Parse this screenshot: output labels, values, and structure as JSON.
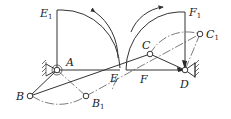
{
  "figure": {
    "type": "linkage-mechanism-diagram",
    "points": {
      "A": {
        "label": "A",
        "sub": ""
      },
      "B": {
        "label": "B",
        "sub": ""
      },
      "B1": {
        "label": "B",
        "sub": "1"
      },
      "C": {
        "label": "C",
        "sub": ""
      },
      "C1": {
        "label": "C",
        "sub": "1"
      },
      "D": {
        "label": "D",
        "sub": ""
      },
      "E": {
        "label": "E",
        "sub": ""
      },
      "E1": {
        "label": "E",
        "sub": "1"
      },
      "F": {
        "label": "F",
        "sub": ""
      },
      "F1": {
        "label": "F",
        "sub": "1"
      }
    },
    "colors": {
      "line": "#333333",
      "background": "#ffffff"
    }
  }
}
